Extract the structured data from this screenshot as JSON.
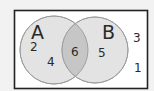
{
  "diagram": {
    "type": "venn",
    "colors": {
      "page_background": "#f2f2f2",
      "universe_fill": "#ffffff",
      "universe_border": "#222222",
      "circle_fill": "#e3e3e3",
      "circle_stroke": "#9a9a9a",
      "intersection_fill": "#c6c6c6"
    },
    "sets": [
      {
        "label": "A",
        "only_elements": [
          "2",
          "4"
        ]
      },
      {
        "label": "B",
        "only_elements": [
          "5"
        ]
      }
    ],
    "intersection": {
      "elements": [
        "6"
      ]
    },
    "outside": {
      "elements": [
        "3",
        "1"
      ]
    }
  }
}
